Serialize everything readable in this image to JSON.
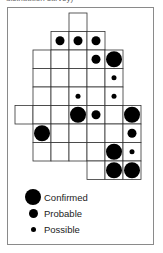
{
  "caption": "distribution survey)",
  "map": {
    "cells": [
      {
        "row": 0,
        "col": 3,
        "status": null
      },
      {
        "row": 1,
        "col": 2,
        "status": "probable"
      },
      {
        "row": 1,
        "col": 3,
        "status": "probable"
      },
      {
        "row": 1,
        "col": 4,
        "status": "probable"
      },
      {
        "row": 2,
        "col": 1,
        "status": null
      },
      {
        "row": 2,
        "col": 2,
        "status": null
      },
      {
        "row": 2,
        "col": 3,
        "status": null
      },
      {
        "row": 2,
        "col": 4,
        "status": "probable"
      },
      {
        "row": 2,
        "col": 5,
        "status": "confirmed"
      },
      {
        "row": 3,
        "col": 1,
        "status": null
      },
      {
        "row": 3,
        "col": 2,
        "status": null
      },
      {
        "row": 3,
        "col": 3,
        "status": null
      },
      {
        "row": 3,
        "col": 4,
        "status": null
      },
      {
        "row": 3,
        "col": 5,
        "status": "possible"
      },
      {
        "row": 4,
        "col": 1,
        "status": null
      },
      {
        "row": 4,
        "col": 2,
        "status": null
      },
      {
        "row": 4,
        "col": 3,
        "status": "possible"
      },
      {
        "row": 4,
        "col": 4,
        "status": null
      },
      {
        "row": 4,
        "col": 5,
        "status": "possible"
      },
      {
        "row": 5,
        "col": 0,
        "status": null
      },
      {
        "row": 5,
        "col": 1,
        "status": null
      },
      {
        "row": 5,
        "col": 2,
        "status": null
      },
      {
        "row": 5,
        "col": 3,
        "status": "confirmed"
      },
      {
        "row": 5,
        "col": 4,
        "status": "probable"
      },
      {
        "row": 5,
        "col": 5,
        "status": null
      },
      {
        "row": 5,
        "col": 6,
        "status": "confirmed"
      },
      {
        "row": 6,
        "col": 1,
        "status": "confirmed"
      },
      {
        "row": 6,
        "col": 2,
        "status": null
      },
      {
        "row": 6,
        "col": 3,
        "status": null
      },
      {
        "row": 6,
        "col": 4,
        "status": null
      },
      {
        "row": 6,
        "col": 5,
        "status": null
      },
      {
        "row": 6,
        "col": 6,
        "status": "probable"
      },
      {
        "row": 7,
        "col": 1,
        "status": null
      },
      {
        "row": 7,
        "col": 2,
        "status": null
      },
      {
        "row": 7,
        "col": 3,
        "status": null
      },
      {
        "row": 7,
        "col": 4,
        "status": null
      },
      {
        "row": 7,
        "col": 5,
        "status": "confirmed"
      },
      {
        "row": 7,
        "col": 6,
        "status": "possible"
      },
      {
        "row": 8,
        "col": 4,
        "status": null
      },
      {
        "row": 8,
        "col": 5,
        "status": "confirmed"
      },
      {
        "row": 8,
        "col": 6,
        "status": "confirmed"
      }
    ]
  },
  "legend": [
    {
      "key": "confirmed",
      "label": "Confirmed"
    },
    {
      "key": "probable",
      "label": "Probable"
    },
    {
      "key": "possible",
      "label": "Possible"
    }
  ]
}
